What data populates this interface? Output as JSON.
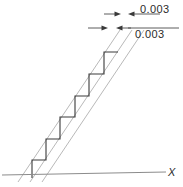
{
  "figure": {
    "background_color": "#ffffff"
  },
  "axis": {
    "x_label": "X",
    "baseline_color": "#8c8c8c"
  },
  "dimensions": [
    {
      "id": "upper-tolerance",
      "label": "0.003",
      "position": "top-right",
      "leader_y": 14
    },
    {
      "id": "lower-tolerance",
      "label": "0.003",
      "position": "below-top-right",
      "leader_y": 28
    }
  ],
  "tolerance_zone": {
    "line_color": "#b9b9b9",
    "line_count": 3,
    "lines": [
      {
        "x1": 18,
        "y1": 182,
        "x2": 120,
        "y2": 30
      },
      {
        "x1": 30,
        "y1": 182,
        "x2": 132,
        "y2": 30
      },
      {
        "x1": 42,
        "y1": 182,
        "x2": 144,
        "y2": 30
      }
    ]
  },
  "step_profile": {
    "line_color": "#3a3a3a",
    "step_count": 6,
    "points": [
      [
        32,
        178
      ],
      [
        32,
        160
      ],
      [
        46,
        160
      ],
      [
        46,
        139
      ],
      [
        60,
        139
      ],
      [
        60,
        117
      ],
      [
        75,
        117
      ],
      [
        75,
        96
      ],
      [
        89,
        96
      ],
      [
        89,
        74
      ],
      [
        104,
        74
      ],
      [
        104,
        52
      ],
      [
        118,
        52
      ]
    ]
  },
  "colors": {
    "tolerance_line": "#b9b9b9",
    "profile_line": "#3a3a3a",
    "axis_line": "#8c8c8c",
    "text": "#2b2b2b"
  }
}
